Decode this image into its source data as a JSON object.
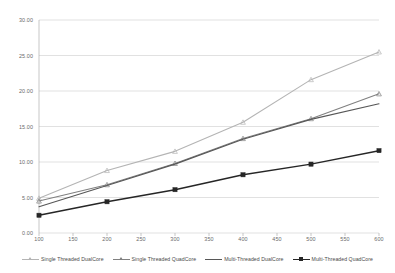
{
  "chart_data": {
    "type": "line",
    "title": "",
    "subtitle": "",
    "xlabel": "",
    "ylabel": "",
    "x": [
      100,
      200,
      300,
      400,
      500,
      600
    ],
    "xlim": [
      100,
      600
    ],
    "ylim": [
      0,
      30
    ],
    "grid": true,
    "legend_position": "bottom",
    "x_tick_labels": [
      "100",
      "150",
      "200",
      "250",
      "300",
      "350",
      "400",
      "450",
      "500",
      "550",
      "600"
    ],
    "x_tick_values": [
      100,
      150,
      200,
      250,
      300,
      350,
      400,
      450,
      500,
      550,
      600
    ],
    "y_tick_labels": [
      "0.00",
      "5.00",
      "10.00",
      "15.00",
      "20.00",
      "25.00",
      "30.00"
    ],
    "y_tick_values": [
      0,
      5,
      10,
      15,
      20,
      25,
      30
    ],
    "series": [
      {
        "name": "Single Threaded DualCore",
        "values": [
          4.9,
          8.8,
          11.5,
          15.6,
          21.6,
          25.5
        ],
        "color": "#b4b4b4",
        "marker": "triangle"
      },
      {
        "name": "Single Threaded QuadCore",
        "values": [
          4.5,
          6.8,
          9.8,
          13.3,
          16.1,
          19.6
        ],
        "color": "#808080",
        "marker": "triangle"
      },
      {
        "name": "Multi-Threaded DualCore",
        "values": [
          3.7,
          6.7,
          9.7,
          13.2,
          16.0,
          18.2
        ],
        "color": "#575757",
        "marker": "line"
      },
      {
        "name": "Multi-Threaded QuadCore",
        "values": [
          2.5,
          4.4,
          6.1,
          8.2,
          9.7,
          11.6
        ],
        "color": "#262626",
        "marker": "square"
      }
    ]
  },
  "axis_colors": {
    "gridline": "#d4d4d4",
    "axis_line": "#b0b0b0",
    "tick_text": "#6a6a6a"
  }
}
